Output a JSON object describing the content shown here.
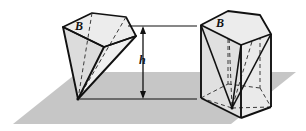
{
  "figure": {
    "type": "geometry-diagram",
    "width": 306,
    "height": 131,
    "background_color": "#ffffff",
    "stroke_color": "#111111",
    "plane": {
      "name": "ground-plane",
      "fill_color": "#c6c6c6",
      "points": "13,124 78,72 296,72 231,124"
    },
    "labels": {
      "base_left": "B",
      "base_right": "B",
      "height": "h"
    },
    "dimension": {
      "name": "height-dimension",
      "label": "h",
      "top_line_y": 26,
      "bottom_line_y": 99,
      "arrow_x": 143,
      "top_leader": "M 128,26 L 196,26",
      "bottom_leader": "M 80,99 L 196,99"
    },
    "left_solid": {
      "name": "pentagonal-pyramid",
      "description": "Pentagonal pyramid with base B on top and apex touching the plane",
      "face_fill": "#e8e8e8",
      "face_fill_dark": "#d8d8d8",
      "top_face": "63,27 92,13 126,17 136,36 104,47",
      "apex": "78,99",
      "visible_edges": [
        "M 63,27 L 92,13 L 126,17 L 136,36 L 104,47 Z",
        "M 63,27 L 78,99",
        "M 136,36 L 78,99",
        "M 104,47 L 78,99"
      ],
      "hidden_edges": [
        "M 92,13 L 78,99",
        "M 126,17 L 78,99"
      ],
      "shaded_faces": [
        "63,27 104,47 78,99",
        "104,47 136,36 78,99"
      ]
    },
    "right_solid": {
      "name": "pentagonal-prism-with-inscribed-pyramid",
      "description": "Pentagonal prism over base B with an inscribed pyramid drawn dashed inside",
      "face_fill": "#ededed",
      "face_fill_dark": "#dcdcdc",
      "top_face": "201,25 228,11 260,15 271,34 241,45",
      "bottom_face": "201,98 228,84 260,88 271,107 241,118",
      "vertical_edges": [
        "M 201,25 L 201,98",
        "M 241,45 L 241,118",
        "M 271,34 L 271,107",
        "M 228,11 L 228,84",
        "M 260,15 L 260,88"
      ],
      "inner_pyramid_apex": "232,108",
      "inner_pyramid_edges": [
        "M 201,25 L 232,108",
        "M 271,34 L 232,108",
        "M 241,45 L 232,108"
      ],
      "inner_pyramid_hidden_edges": [
        "M 228,11 L 232,108",
        "M 260,15 L 232,108"
      ]
    }
  }
}
